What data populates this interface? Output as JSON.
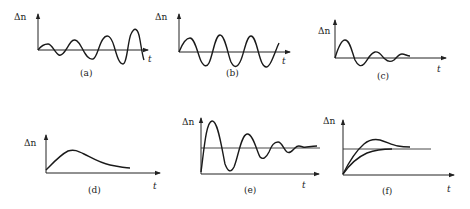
{
  "figure": {
    "y_axis_label": "Δn",
    "x_axis_label": "t",
    "panels": [
      {
        "id": "a",
        "caption": "(a)",
        "behavior": "divergent oscillation (growing amplitude)"
      },
      {
        "id": "b",
        "caption": "(b)",
        "behavior": "sustained constant-amplitude oscillation"
      },
      {
        "id": "c",
        "caption": "(c)",
        "behavior": "damped oscillation around zero"
      },
      {
        "id": "d",
        "caption": "(d)",
        "behavior": "single rise then monotonic decay"
      },
      {
        "id": "e",
        "caption": "(e)",
        "behavior": "damped oscillation settling to a nonzero level"
      },
      {
        "id": "f",
        "caption": "(f)",
        "behavior": "overshoot and non-overshoot approach to a steady level"
      }
    ]
  }
}
